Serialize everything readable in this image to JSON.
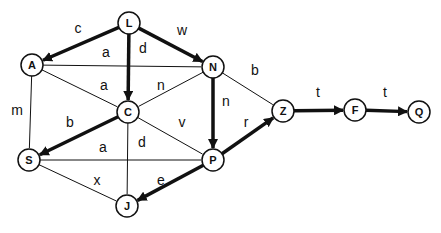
{
  "diagram": {
    "type": "directed-graph",
    "colors": {
      "stroke": "#111111",
      "background": "#ffffff",
      "node_fill": "#ffffff"
    },
    "node_radius": 11,
    "nodes": [
      {
        "id": "L",
        "label": "L",
        "x": 129,
        "y": 23
      },
      {
        "id": "A",
        "label": "A",
        "x": 32,
        "y": 65
      },
      {
        "id": "N",
        "label": "N",
        "x": 213,
        "y": 67
      },
      {
        "id": "C",
        "label": "C",
        "x": 128,
        "y": 112
      },
      {
        "id": "S",
        "label": "S",
        "x": 29,
        "y": 160
      },
      {
        "id": "P",
        "label": "P",
        "x": 213,
        "y": 160
      },
      {
        "id": "J",
        "label": "J",
        "x": 127,
        "y": 206
      },
      {
        "id": "Z",
        "label": "Z",
        "x": 283,
        "y": 111
      },
      {
        "id": "F",
        "label": "F",
        "x": 355,
        "y": 110
      },
      {
        "id": "Q",
        "label": "Q",
        "x": 419,
        "y": 112
      }
    ],
    "edges": [
      {
        "from": "L",
        "to": "A",
        "label": "c",
        "directed": true,
        "lx": 78,
        "ly": 33
      },
      {
        "from": "L",
        "to": "N",
        "label": "w",
        "directed": true,
        "lx": 182,
        "ly": 35
      },
      {
        "from": "L",
        "to": "C",
        "label": "d",
        "directed": true,
        "lx": 143,
        "ly": 53
      },
      {
        "from": "A",
        "to": "N",
        "label": "a",
        "directed": false,
        "lx": 106,
        "ly": 57
      },
      {
        "from": "A",
        "to": "C",
        "label": "a",
        "directed": false,
        "lx": 104,
        "ly": 90
      },
      {
        "from": "N",
        "to": "C",
        "label": "n",
        "directed": false,
        "lx": 161,
        "ly": 90
      },
      {
        "from": "A",
        "to": "S",
        "label": "m",
        "directed": false,
        "lx": 17,
        "ly": 115
      },
      {
        "from": "N",
        "to": "P",
        "label": "n",
        "directed": true,
        "lx": 226,
        "ly": 106
      },
      {
        "from": "N",
        "to": "Z",
        "label": "b",
        "directed": false,
        "lx": 255,
        "ly": 75
      },
      {
        "from": "C",
        "to": "S",
        "label": "b",
        "directed": true,
        "lx": 70,
        "ly": 127
      },
      {
        "from": "C",
        "to": "P",
        "label": "v",
        "directed": false,
        "lx": 182,
        "ly": 127
      },
      {
        "from": "C",
        "to": "J",
        "label": "d",
        "directed": false,
        "lx": 142,
        "ly": 147
      },
      {
        "from": "S",
        "to": "P",
        "label": "a",
        "directed": false,
        "lx": 103,
        "ly": 152
      },
      {
        "from": "S",
        "to": "J",
        "label": "x",
        "directed": false,
        "lx": 97,
        "ly": 185
      },
      {
        "from": "P",
        "to": "J",
        "label": "e",
        "directed": true,
        "lx": 161,
        "ly": 185
      },
      {
        "from": "P",
        "to": "Z",
        "label": "r",
        "directed": true,
        "lx": 246,
        "ly": 127
      },
      {
        "from": "Z",
        "to": "F",
        "label": "t",
        "directed": true,
        "lx": 318,
        "ly": 97
      },
      {
        "from": "F",
        "to": "Q",
        "label": "t",
        "directed": true,
        "lx": 385,
        "ly": 97
      }
    ]
  }
}
